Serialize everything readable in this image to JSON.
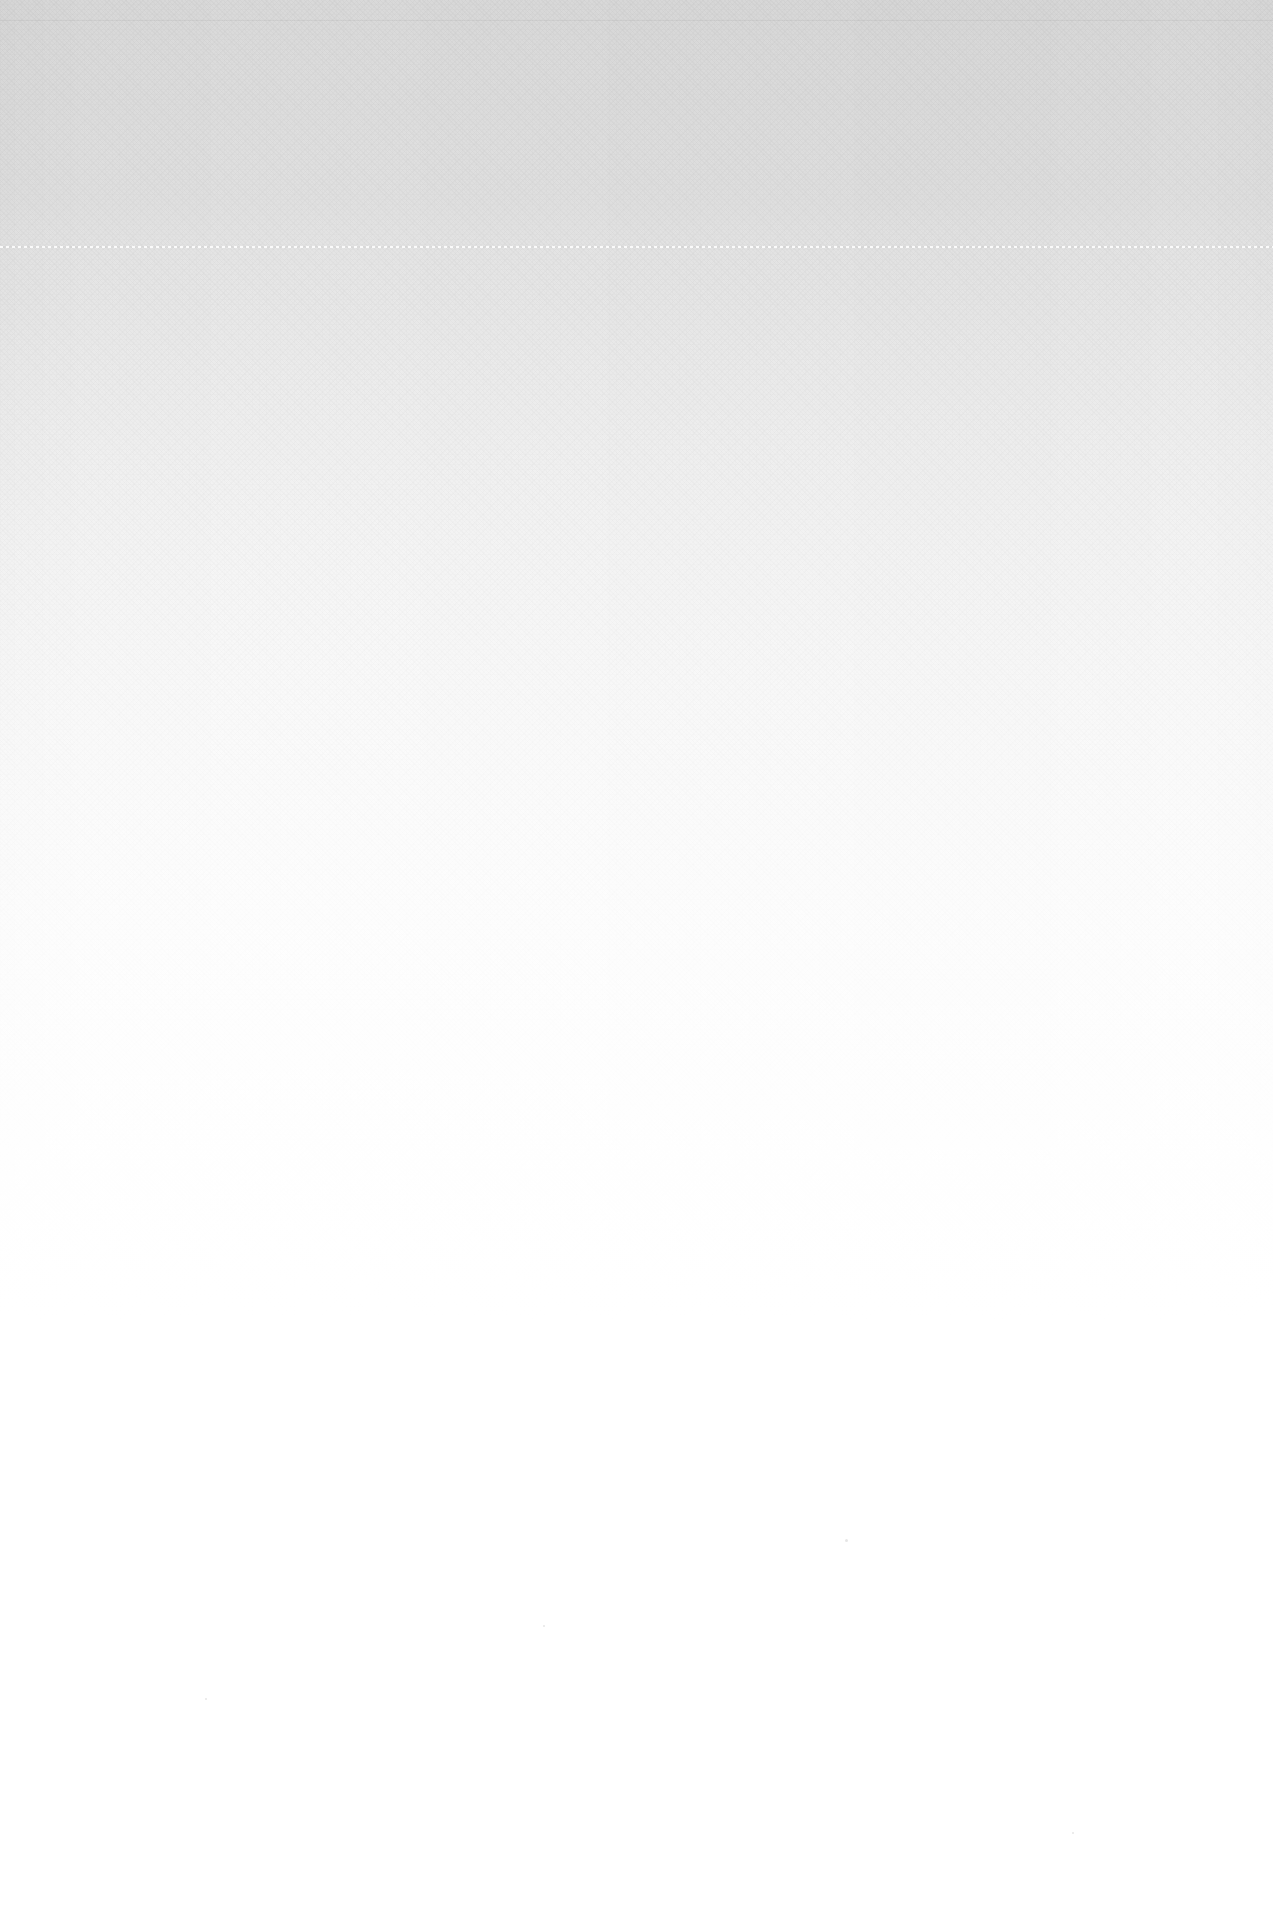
{
  "page": {
    "kind": "blank-scanned-page",
    "width": 1273,
    "height": 1920,
    "text_content": "",
    "background_color": "#ffffff",
    "top_tone_color": "#d9d9d9",
    "bottom_tone_color": "#ffffff"
  },
  "rules": [
    {
      "name": "top-hairline",
      "style": "solid",
      "y": 20,
      "color": "#f2f2f2"
    },
    {
      "name": "dotted-separator",
      "style": "dotted",
      "y": 246,
      "color": "#e0e0e0"
    }
  ],
  "specks": [
    {
      "x": 845,
      "y": 1539,
      "size": 3
    },
    {
      "x": 543,
      "y": 1625,
      "size": 2
    },
    {
      "x": 205,
      "y": 1698,
      "size": 2
    },
    {
      "x": 1072,
      "y": 1832,
      "size": 2
    }
  ]
}
